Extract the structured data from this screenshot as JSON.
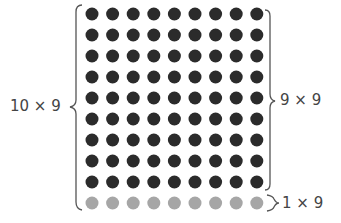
{
  "labels": {
    "left": "10 × 9",
    "right_top": "9 × 9",
    "right_bottom": "1 × 9"
  },
  "grid": {
    "columns": 9,
    "dark_rows": 9,
    "light_rows": 1,
    "origin_x": 92,
    "origin_y": 14,
    "spacing_x": 20.6,
    "spacing_y": 21,
    "dot_radius": 6.5
  },
  "colors": {
    "dark_dot": "#2b2b2b",
    "light_dot": "#a6a6a6",
    "brace": "#555555",
    "text": "#444444"
  }
}
